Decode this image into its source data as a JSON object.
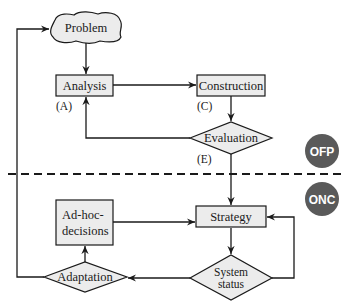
{
  "colors": {
    "stroke": "#1a1a1a",
    "node_fill": "#ececec",
    "badge_fill": "#5a5a5a",
    "badge_text": "#ffffff",
    "background": "#ffffff"
  },
  "nodes": {
    "problem": {
      "label": "Problem",
      "shape": "cloud"
    },
    "analysis": {
      "label": "Analysis",
      "shape": "rect",
      "tag": "(A)"
    },
    "construction": {
      "label": "Construction",
      "shape": "rect",
      "tag": "(C)"
    },
    "evaluation": {
      "label": "Evaluation",
      "shape": "diamond",
      "tag": "(E)"
    },
    "strategy": {
      "label": "Strategy",
      "shape": "rect"
    },
    "system_status": {
      "label_line1": "System",
      "label_line2": "status",
      "shape": "diamond"
    },
    "adhoc": {
      "label_line1": "Ad-hoc-",
      "label_line2": "decisions",
      "shape": "rect"
    },
    "adaptation": {
      "label": "Adaptation",
      "shape": "diamond"
    }
  },
  "badges": {
    "offline": {
      "label": "OFP"
    },
    "online": {
      "label": "ONC"
    }
  },
  "edges": [
    {
      "from": "problem",
      "to": "analysis"
    },
    {
      "from": "analysis",
      "to": "construction"
    },
    {
      "from": "construction",
      "to": "evaluation"
    },
    {
      "from": "evaluation",
      "to": "analysis"
    },
    {
      "from": "evaluation",
      "to": "strategy"
    },
    {
      "from": "strategy",
      "to": "system_status"
    },
    {
      "from": "system_status",
      "to": "strategy"
    },
    {
      "from": "system_status",
      "to": "adaptation"
    },
    {
      "from": "adaptation",
      "to": "adhoc"
    },
    {
      "from": "adhoc",
      "to": "strategy"
    },
    {
      "from": "adaptation",
      "to": "problem"
    }
  ],
  "separator": {
    "style": "dashed",
    "divides": [
      "OFP",
      "ONC"
    ]
  }
}
